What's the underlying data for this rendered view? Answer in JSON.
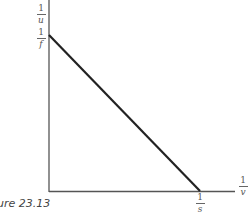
{
  "figure": {
    "caption": "ure 23.13",
    "y_axis_label": {
      "num": "1",
      "den": "u"
    },
    "x_axis_label": {
      "num": "1",
      "den": "v"
    },
    "y_intercept_label": {
      "num": "1",
      "den": "f"
    },
    "x_intercept_label": {
      "num": "1",
      "den": "s"
    },
    "colors": {
      "axis": "#555555",
      "line": "#222222"
    }
  }
}
